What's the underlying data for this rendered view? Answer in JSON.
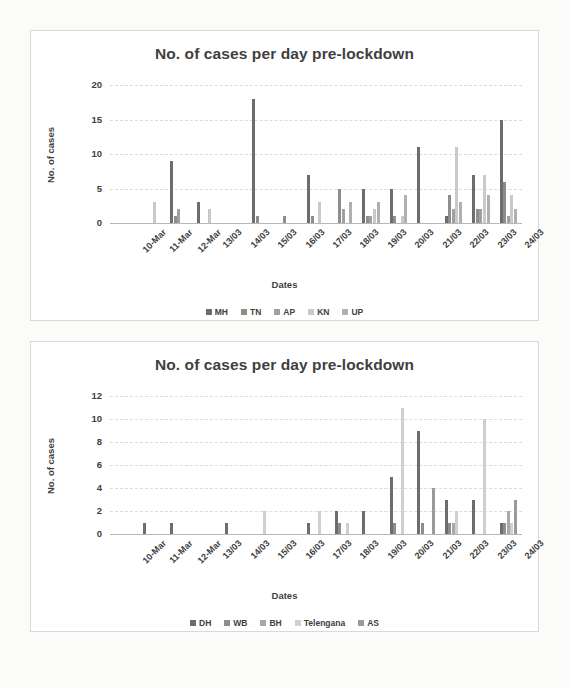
{
  "page": {
    "background": "#fbfbfa"
  },
  "charts": [
    {
      "id": "chart-1",
      "title": "No. of cases per day pre-lockdown",
      "xlabel": "Dates",
      "ylabel": "No. of cases"
    },
    {
      "id": "chart-2",
      "title": "No. of cases per day pre-lockdown",
      "xlabel": "Dates",
      "ylabel": "No. of cases"
    }
  ],
  "chart_data": [
    {
      "type": "bar",
      "title": "No. of cases per day pre-lockdown",
      "xlabel": "Dates",
      "ylabel": "No. of cases",
      "ylim": [
        0,
        20
      ],
      "yticks": [
        0,
        5,
        10,
        15,
        20
      ],
      "grid": true,
      "legend_position": "bottom",
      "categories": [
        "10-Mar",
        "11-Mar",
        "12-Mar",
        "13/03",
        "14/03",
        "15/03",
        "16/03",
        "17/03",
        "18/03",
        "19/03",
        "20/03",
        "21/03",
        "22/03",
        "23/03",
        "24/03"
      ],
      "series": [
        {
          "name": "MH",
          "color": "#6d6d6d",
          "values": [
            0,
            0,
            9,
            3,
            0,
            18,
            0,
            7,
            0,
            5,
            5,
            11,
            1,
            7,
            15
          ]
        },
        {
          "name": "TN",
          "color": "#8d8d8d",
          "values": [
            0,
            0,
            1,
            0,
            0,
            1,
            1,
            1,
            5,
            1,
            1,
            0,
            4,
            2,
            6
          ]
        },
        {
          "name": "AP",
          "color": "#a0a0a0",
          "values": [
            0,
            0,
            2,
            0,
            0,
            0,
            0,
            0,
            2,
            1,
            0,
            0,
            2,
            2,
            1
          ]
        },
        {
          "name": "KN",
          "color": "#c9c9c9",
          "values": [
            0,
            3,
            0,
            2,
            0,
            0,
            0,
            3,
            0,
            2,
            1,
            0,
            11,
            7,
            4
          ]
        },
        {
          "name": "UP",
          "color": "#b0b0b0",
          "values": [
            0,
            0,
            0,
            0,
            0,
            0,
            0,
            0,
            3,
            3,
            4,
            0,
            3,
            4,
            2
          ]
        }
      ]
    },
    {
      "type": "bar",
      "title": "No. of cases per day pre-lockdown",
      "xlabel": "Dates",
      "ylabel": "No. of cases",
      "ylim": [
        0,
        12
      ],
      "yticks": [
        0,
        2,
        4,
        6,
        8,
        10,
        12
      ],
      "grid": true,
      "legend_position": "bottom",
      "categories": [
        "10-Mar",
        "11-Mar",
        "12-Mar",
        "13/03",
        "14/03",
        "15/03",
        "16/03",
        "17/03",
        "18/03",
        "19/03",
        "20/03",
        "21/03",
        "22/03",
        "23/03",
        "24/03"
      ],
      "series": [
        {
          "name": "DH",
          "color": "#6d6d6d",
          "values": [
            0,
            1,
            1,
            0,
            1,
            0,
            0,
            1,
            2,
            2,
            5,
            9,
            3,
            3,
            1
          ]
        },
        {
          "name": "WB",
          "color": "#8d8d8d",
          "values": [
            0,
            0,
            0,
            0,
            0,
            0,
            0,
            0,
            1,
            0,
            1,
            1,
            1,
            0,
            1
          ]
        },
        {
          "name": "BH",
          "color": "#a8a8a8",
          "values": [
            0,
            0,
            0,
            0,
            0,
            0,
            0,
            0,
            0,
            0,
            0,
            0,
            1,
            0,
            2
          ]
        },
        {
          "name": "Telengana",
          "color": "#cfcfcf",
          "values": [
            0,
            0,
            0,
            0,
            0,
            2,
            0,
            2,
            1,
            0,
            11,
            0,
            2,
            10,
            1
          ]
        },
        {
          "name": "AS",
          "color": "#9a9a9a",
          "values": [
            0,
            0,
            0,
            0,
            0,
            0,
            0,
            0,
            0,
            0,
            0,
            4,
            0,
            0,
            3
          ]
        }
      ]
    }
  ]
}
